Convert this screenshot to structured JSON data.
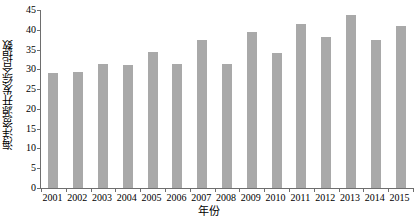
{
  "chart_data": {
    "type": "bar",
    "title": "",
    "subtitle": "",
    "xlabel": "年份",
    "ylabel": "海洋资源开发综合指数",
    "categories": [
      "2001",
      "2002",
      "2003",
      "2004",
      "2005",
      "2006",
      "2007",
      "2008",
      "2009",
      "2010",
      "2011",
      "2012",
      "2013",
      "2014",
      "2015"
    ],
    "values": [
      29.2,
      29.3,
      31.3,
      31.2,
      34.3,
      31.4,
      37.5,
      31.3,
      39.4,
      34.2,
      41.5,
      38.3,
      43.8,
      37.5,
      41.0
    ],
    "series": [
      {
        "name": "海洋资源开发综合指数",
        "values": [
          29.2,
          29.3,
          31.3,
          31.2,
          34.3,
          31.4,
          37.5,
          31.3,
          39.4,
          34.2,
          41.5,
          38.3,
          43.8,
          37.5,
          41.0
        ]
      }
    ],
    "ylim": [
      0,
      45
    ],
    "ytick_values": [
      0,
      5,
      10,
      15,
      20,
      25,
      30,
      35,
      40,
      45
    ],
    "ytick_labels": [
      "0",
      "5",
      "10",
      "15",
      "20",
      "25",
      "30",
      "35",
      "40",
      "45"
    ],
    "xtick_labels": [
      "2001",
      "2002",
      "2003",
      "2004",
      "2005",
      "2006",
      "2007",
      "2008",
      "2009",
      "2010",
      "2011",
      "2012",
      "2013",
      "2014",
      "2015"
    ],
    "grid": false,
    "legend": false,
    "legend_position": "none",
    "annotations": [],
    "bar_color": "#a9a9a9",
    "axis_color": "#6e6e6e",
    "background_color": "#ffffff"
  }
}
